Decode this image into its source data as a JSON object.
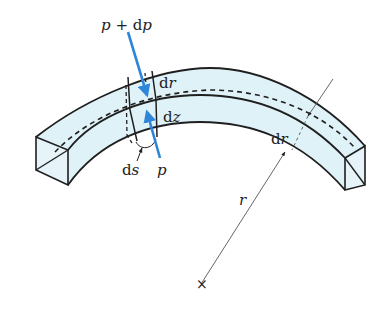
{
  "figure": {
    "colors": {
      "fill": "#dff2f8",
      "outline": "#1f1f1f",
      "arrow": "#2f86d8",
      "leader": "#555555"
    }
  },
  "labels": {
    "p_plus_dp_var": "p",
    "p_plus_dp_rest": " + d",
    "p_plus_dp_var2": "p",
    "dr_top_d": "d",
    "dr_top_r": "r",
    "dz_d": "d",
    "dz_z": "z",
    "ds_d": "d",
    "ds_s": "s",
    "p_bottom": "p",
    "dr_right_d": "d",
    "dr_right_r": "r",
    "radius": "r",
    "center_mark": "×"
  }
}
